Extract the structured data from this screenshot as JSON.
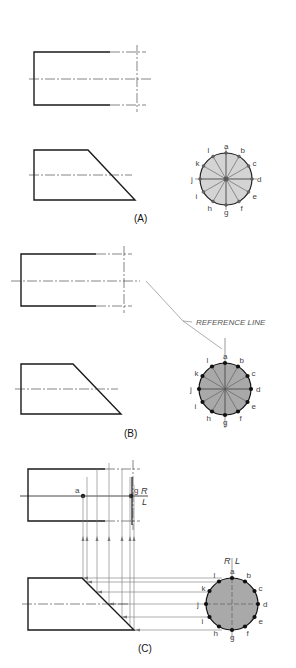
{
  "figure": {
    "panels": [
      {
        "id": "A",
        "caption": "(A)",
        "circle_fill": "#d4d4d4"
      },
      {
        "id": "B",
        "caption": "(B)",
        "circle_fill": "#a9a9a9",
        "callout": "REFERENCE LINE"
      },
      {
        "id": "C",
        "caption": "(C)",
        "circle_fill": "#a9a9a9",
        "top_points": [
          "a",
          "g"
        ],
        "plane_labels": {
          "right": "R",
          "left": "L"
        }
      }
    ],
    "circle_labels": [
      "a",
      "b",
      "c",
      "d",
      "e",
      "f",
      "g",
      "h",
      "i",
      "j",
      "k",
      "l"
    ]
  }
}
